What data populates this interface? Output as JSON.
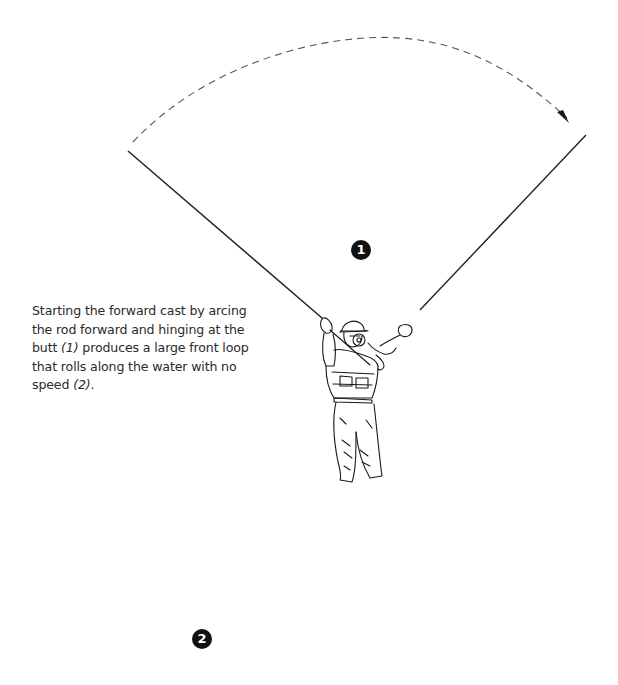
{
  "figure": {
    "caption": {
      "part1": "Starting the forward cast by arcing the rod forward and hinging at the butt ",
      "ref1": "(1)",
      "part2": " produces a large front loop that rolls along the water with no speed ",
      "ref2": "(2)",
      "part3": "."
    },
    "step_markers": [
      {
        "number": "1",
        "label": "Rod arcing forward, hinging at the butt"
      },
      {
        "number": "2",
        "label": "Large front loop rolling along the water"
      }
    ],
    "illustration_elements": {
      "arc_arrow": "dashed-arc-arrow-icon",
      "rod_back_position": "rod-back-line",
      "rod_forward_position": "rod-forward-line",
      "angler_upper": "angler-casting-figure",
      "angler_lower": "angler-small-figure",
      "fly_line_loop": "large-front-loop-line"
    },
    "colors": {
      "ink": "#1a1a1a",
      "dashed_arc": "#555555",
      "loop_line": "#666666",
      "badge_fill": "#111111",
      "badge_text": "#ffffff",
      "caption_text": "#2a2a2a"
    }
  }
}
